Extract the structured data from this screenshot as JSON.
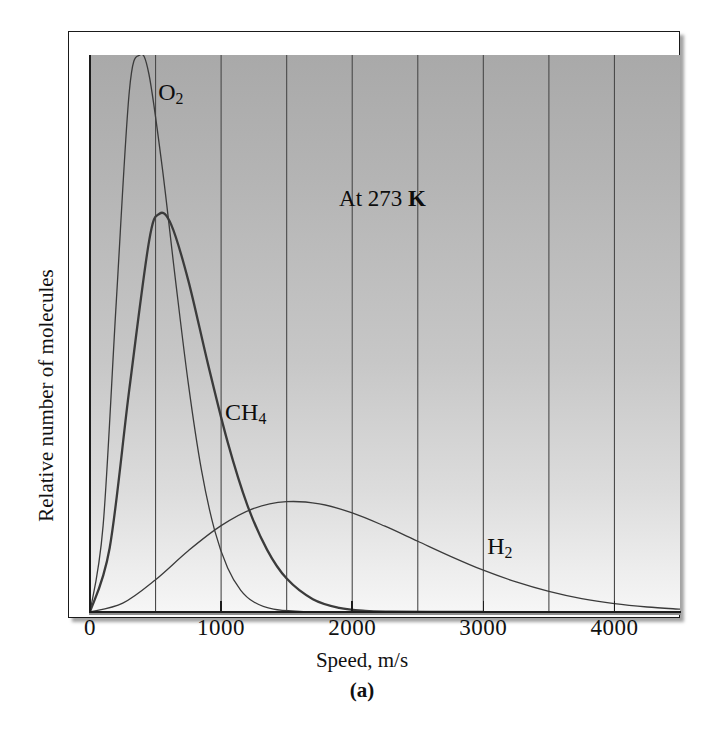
{
  "figure": {
    "panel_label": "(a)",
    "annotation": {
      "prefix": "At 273",
      "unit": "K",
      "full": "At 273 K"
    }
  },
  "axes": {
    "x_title": "Speed, m/s",
    "y_title": "Relative number of molecules",
    "x_tick_labels": [
      "0",
      "1000",
      "2000",
      "3000",
      "4000"
    ],
    "x_tick_values": [
      0,
      1000,
      2000,
      3000,
      4000
    ],
    "gridline_values": [
      500,
      1000,
      1500,
      2000,
      2500,
      3000,
      3500,
      4000
    ]
  },
  "curve_labels": {
    "o2": {
      "text": "O",
      "sub": "2"
    },
    "ch4": {
      "text": "CH",
      "sub": "4"
    },
    "h2": {
      "text": "H",
      "sub": "2"
    }
  },
  "colors": {
    "curve": "#3b3b3b",
    "gridline": "#4a4a4a",
    "axis": "#1c1c1c",
    "plot_top": "#a9a9a9",
    "plot_bottom": "#f6f6f6"
  },
  "chart_data": {
    "type": "line",
    "title": "",
    "subtitle": "",
    "xlabel": "Speed, m/s",
    "ylabel": "Relative number of molecules",
    "xlim": [
      0,
      4500
    ],
    "ylim": [
      0,
      1.0
    ],
    "grid": true,
    "grid_axis": "x",
    "grid_spacing": 500,
    "legend": "inline-labels",
    "annotations": [
      {
        "text": "At 273 K",
        "x": 1900,
        "y": 0.74
      }
    ],
    "series": [
      {
        "name": "O2",
        "label": "O₂",
        "most_probable_speed": 380,
        "peak_relative_height": 1.0,
        "line_width": "thin",
        "label_position": {
          "x": 520,
          "y": 0.93
        },
        "x": [
          0,
          100,
          200,
          300,
          380,
          450,
          550,
          650,
          750,
          850,
          950,
          1050,
          1150,
          1250,
          1400,
          1600,
          1800,
          2000,
          2300
        ],
        "y": [
          0.0,
          0.155,
          0.555,
          0.935,
          1.0,
          0.965,
          0.8,
          0.6,
          0.41,
          0.255,
          0.147,
          0.079,
          0.039,
          0.018,
          0.005,
          0.001,
          0.0002,
          0.0,
          0.0
        ]
      },
      {
        "name": "CH4",
        "label": "CH₄",
        "most_probable_speed": 530,
        "peak_relative_height": 0.715,
        "line_width": "thick",
        "label_position": {
          "x": 1030,
          "y": 0.355
        },
        "x": [
          0,
          150,
          300,
          450,
          530,
          620,
          750,
          900,
          1050,
          1200,
          1350,
          1500,
          1700,
          1900,
          2100,
          2300,
          2600,
          3000
        ],
        "y": [
          0.0,
          0.115,
          0.4,
          0.665,
          0.715,
          0.695,
          0.595,
          0.445,
          0.305,
          0.192,
          0.112,
          0.06,
          0.023,
          0.0075,
          0.002,
          0.0006,
          0.0001,
          0.0
        ]
      },
      {
        "name": "H2",
        "label": "H₂",
        "most_probable_speed": 1500,
        "peak_relative_height": 0.198,
        "line_width": "thin",
        "label_position": {
          "x": 3030,
          "y": 0.115
        },
        "x": [
          0,
          250,
          500,
          750,
          1000,
          1250,
          1500,
          1750,
          2000,
          2250,
          2500,
          2750,
          3000,
          3250,
          3500,
          3750,
          4000,
          4250,
          4500
        ],
        "y": [
          0.0,
          0.016,
          0.058,
          0.11,
          0.155,
          0.186,
          0.198,
          0.194,
          0.178,
          0.154,
          0.127,
          0.1,
          0.075,
          0.054,
          0.037,
          0.024,
          0.015,
          0.009,
          0.005
        ]
      }
    ]
  }
}
